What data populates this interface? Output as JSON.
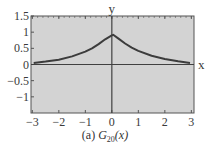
{
  "chart_data": {
    "type": "line",
    "title": "",
    "caption": {
      "prefix": "(a) ",
      "func": "G",
      "sub": "20",
      "arg": "(x)"
    },
    "xlabel": "x",
    "ylabel": "y",
    "xlim": [
      -3.05,
      3.1
    ],
    "ylim": [
      -1.5,
      1.5
    ],
    "xticks": [
      -3,
      -2,
      -1,
      0,
      1,
      2,
      3
    ],
    "xtick_labels": [
      "−3",
      "−2",
      "−1",
      "0",
      "1",
      "2",
      "3"
    ],
    "yticks": [
      1.5,
      1,
      0.5,
      0,
      -0.5,
      -1
    ],
    "ytick_labels": [
      "1.5",
      "1",
      "0.5",
      "0",
      "−0.5",
      "−1"
    ],
    "grid": false,
    "series": [
      {
        "name": "G20(x)",
        "x": [
          -2.95,
          -2.5,
          -2.0,
          -1.5,
          -1.0,
          -0.75,
          -0.5,
          -0.25,
          0.0,
          0.05,
          0.25,
          0.5,
          0.75,
          1.0,
          1.5,
          2.0,
          2.5,
          2.95
        ],
        "y": [
          0.05,
          0.09,
          0.15,
          0.25,
          0.4,
          0.5,
          0.63,
          0.78,
          0.9,
          0.92,
          0.8,
          0.65,
          0.52,
          0.42,
          0.27,
          0.17,
          0.1,
          0.05
        ]
      }
    ],
    "colors": {
      "plot_bg": "#d3d3d3",
      "curve": "#3c3c3c",
      "axis": "#404040",
      "frame": "#555555"
    }
  }
}
